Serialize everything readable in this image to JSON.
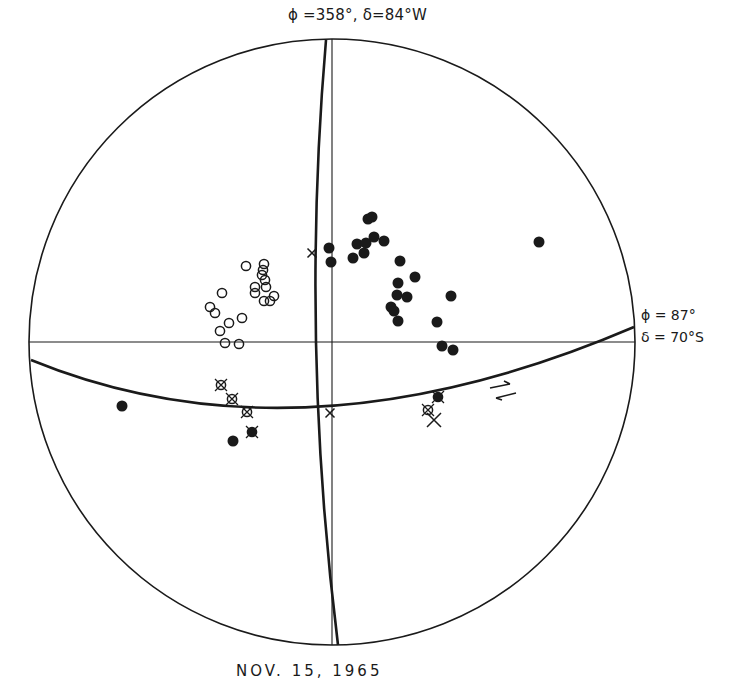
{
  "labels": {
    "top_pole": "ϕ =358°, δ=84°W",
    "right_pole_phi": "ϕ = 87°",
    "right_pole_delta": "δ = 70°S",
    "date": "NOV.   15,   1965"
  },
  "colors": {
    "ink": "#1a1a1a",
    "background": "#ffffff"
  },
  "chart_data": {
    "type": "scatter",
    "title": "NOV. 15, 1965",
    "projection": "stereographic net (equal-angle), primitive circle with vertical and horizontal diameters",
    "annotations": [
      {
        "text": "ϕ =358°, δ=84°W",
        "position": "top, pole of near-vertical great circle"
      },
      {
        "text": "ϕ = 87°, δ = 70°S",
        "position": "right, pole of near-horizontal great circle"
      },
      {
        "text": "sense-of-motion arrows (opposed half-arrows)",
        "position": "right side near great circle"
      }
    ],
    "great_circles": [
      {
        "name": "near-vertical plane",
        "pole": "ϕ=358°, δ=84°W"
      },
      {
        "name": "near-horizontal plane",
        "pole": "ϕ=87°, δ=70°S"
      }
    ],
    "legend_symbols": [
      "filled circle",
      "open circle",
      "crossed circle",
      "crossed filled circle",
      "cross (x)"
    ],
    "series": [
      {
        "name": "filled",
        "symbol": "filled-circle",
        "points_px": [
          [
            368,
            219
          ],
          [
            372,
            217
          ],
          [
            329,
            248
          ],
          [
            331,
            262
          ],
          [
            357,
            244
          ],
          [
            366,
            243
          ],
          [
            374,
            237
          ],
          [
            384,
            241
          ],
          [
            364,
            253
          ],
          [
            353,
            258
          ],
          [
            400,
            261
          ],
          [
            415,
            277
          ],
          [
            398,
            283
          ],
          [
            397,
            295
          ],
          [
            391,
            307
          ],
          [
            394,
            311
          ],
          [
            407,
            297
          ],
          [
            451,
            296
          ],
          [
            437,
            322
          ],
          [
            398,
            321
          ],
          [
            442,
            346
          ],
          [
            453,
            350
          ],
          [
            539,
            242
          ],
          [
            122,
            406
          ],
          [
            233,
            441
          ]
        ]
      },
      {
        "name": "open",
        "symbol": "open-circle",
        "points_px": [
          [
            246,
            266
          ],
          [
            264,
            264
          ],
          [
            263,
            270
          ],
          [
            262,
            275
          ],
          [
            265,
            280
          ],
          [
            255,
            287
          ],
          [
            266,
            287
          ],
          [
            255,
            293
          ],
          [
            264,
            301
          ],
          [
            274,
            296
          ],
          [
            270,
            301
          ],
          [
            222,
            293
          ],
          [
            210,
            307
          ],
          [
            215,
            313
          ],
          [
            229,
            323
          ],
          [
            242,
            318
          ],
          [
            220,
            331
          ],
          [
            225,
            343
          ],
          [
            239,
            344
          ]
        ]
      },
      {
        "name": "crossed",
        "symbol": "crossed-circle",
        "points_px": [
          [
            221,
            385
          ],
          [
            232,
            399
          ],
          [
            247,
            412
          ],
          [
            428,
            410
          ]
        ]
      },
      {
        "name": "crossed-filled",
        "symbol": "crossed-filled-circle",
        "points_px": [
          [
            252,
            432
          ],
          [
            438,
            397
          ]
        ]
      },
      {
        "name": "cross",
        "symbol": "x",
        "points_px": [
          [
            312,
            253
          ],
          [
            330,
            413
          ],
          [
            434,
            420
          ]
        ]
      }
    ]
  }
}
